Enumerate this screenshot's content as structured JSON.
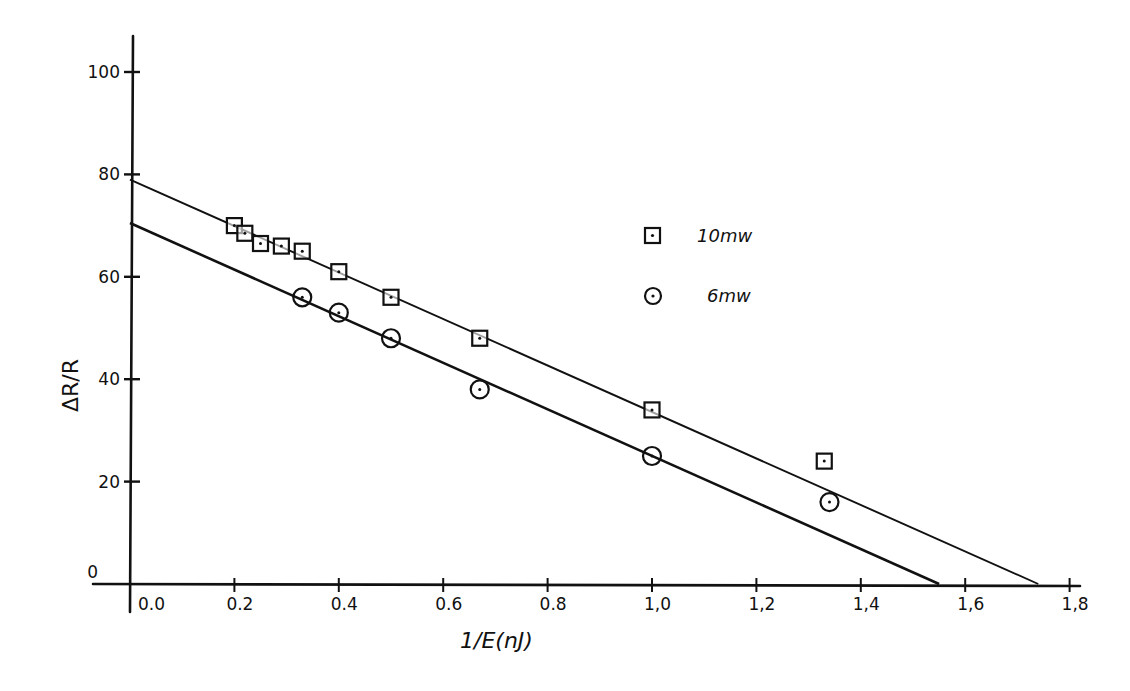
{
  "chart_data": {
    "type": "scatter",
    "title": "",
    "xlabel": "1/E(nJ)",
    "ylabel": "ΔR/R",
    "xlim": [
      0.0,
      1.8
    ],
    "ylim": [
      0,
      100
    ],
    "x_ticks": [
      "0.0",
      "0.2",
      "0.4",
      "0.6",
      "0.8",
      "1.0",
      "1.2",
      "1.4",
      "1.6",
      "1.8"
    ],
    "y_ticks": [
      "0",
      "20",
      "40",
      "60",
      "80",
      "100"
    ],
    "grid": false,
    "legend_position": "upper-right-center",
    "series": [
      {
        "name": "10mw",
        "marker": "square-with-dot",
        "points": [
          {
            "x": 0.2,
            "y": 70
          },
          {
            "x": 0.22,
            "y": 68.5
          },
          {
            "x": 0.25,
            "y": 66.5
          },
          {
            "x": 0.29,
            "y": 66
          },
          {
            "x": 0.33,
            "y": 65
          },
          {
            "x": 0.4,
            "y": 61
          },
          {
            "x": 0.5,
            "y": 56
          },
          {
            "x": 0.67,
            "y": 48
          },
          {
            "x": 1.0,
            "y": 34
          },
          {
            "x": 1.33,
            "y": 24
          }
        ],
        "fit_line": {
          "x0": 0.0,
          "y0": 79,
          "x1": 1.74,
          "y1": 0
        }
      },
      {
        "name": "6mw",
        "marker": "circle-with-dot",
        "points": [
          {
            "x": 0.33,
            "y": 56
          },
          {
            "x": 0.4,
            "y": 53
          },
          {
            "x": 0.5,
            "y": 48
          },
          {
            "x": 0.67,
            "y": 38
          },
          {
            "x": 1.0,
            "y": 25
          },
          {
            "x": 1.34,
            "y": 16
          }
        ],
        "fit_line": {
          "x0": 0.0,
          "y0": 70.5,
          "x1": 1.55,
          "y1": 0
        }
      }
    ],
    "legend": [
      {
        "label": "10mw",
        "marker": "square-with-dot"
      },
      {
        "label": "6mw",
        "marker": "circle-with-dot"
      }
    ]
  },
  "colors": {
    "ink": "#111111",
    "background": "#ffffff"
  }
}
